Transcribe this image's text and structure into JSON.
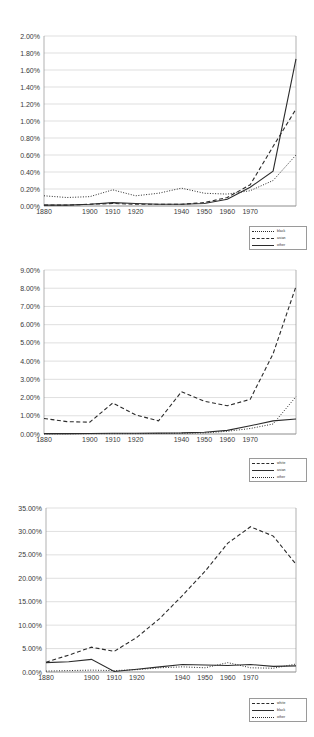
{
  "page": {
    "background": "#ffffff",
    "line_color": "#2b2b2b",
    "grid_color": "#c9c9c9"
  },
  "charts": [
    {
      "id": "chart-1",
      "chart_data": {
        "type": "line",
        "title": "",
        "xlabel": "",
        "ylabel": "",
        "grid": true,
        "legend_position": "bottom-right",
        "xlim": [
          1880,
          1990
        ],
        "ylim": [
          0,
          2.0
        ],
        "yunit": "%",
        "xticks": [
          1880,
          1900,
          1910,
          1920,
          1940,
          1950,
          1960,
          1970
        ],
        "xticklabels": [
          "1880",
          "1900",
          "1910",
          "1920",
          "1940",
          "1950",
          "1960",
          "1970"
        ],
        "yticks": [
          0,
          0.2,
          0.4,
          0.6,
          0.8,
          1.0,
          1.2,
          1.4,
          1.6,
          1.8,
          2.0
        ],
        "yticklabels": [
          "0.00%",
          "0.20%",
          "0.40%",
          "0.60%",
          "0.80%",
          "1.00%",
          "1.20%",
          "1.40%",
          "1.60%",
          "1.80%",
          "2.00%"
        ],
        "x": [
          1880,
          1890,
          1900,
          1910,
          1920,
          1930,
          1940,
          1950,
          1960,
          1970,
          1980,
          1990
        ],
        "series": [
          {
            "name": "black",
            "style": "dotted",
            "values": [
              0.12,
              0.1,
              0.11,
              0.19,
              0.12,
              0.15,
              0.21,
              0.15,
              0.14,
              0.18,
              0.3,
              0.6
            ]
          },
          {
            "name": "asian",
            "style": "dashed",
            "values": [
              0.01,
              0.01,
              0.02,
              0.03,
              0.02,
              0.02,
              0.02,
              0.04,
              0.1,
              0.25,
              0.7,
              1.14
            ]
          },
          {
            "name": "other",
            "style": "solid",
            "values": [
              0.01,
              0.01,
              0.02,
              0.04,
              0.03,
              0.02,
              0.02,
              0.03,
              0.08,
              0.22,
              0.41,
              1.73
            ]
          }
        ]
      },
      "legend": [
        {
          "label": "black",
          "style": "dotted"
        },
        {
          "label": "asian",
          "style": "dashed"
        },
        {
          "label": "other",
          "style": "solid"
        }
      ]
    },
    {
      "id": "chart-2",
      "chart_data": {
        "type": "line",
        "title": "",
        "xlabel": "",
        "ylabel": "",
        "grid": true,
        "legend_position": "bottom-right",
        "xlim": [
          1880,
          1990
        ],
        "ylim": [
          0,
          9.0
        ],
        "yunit": "%",
        "xticks": [
          1880,
          1900,
          1910,
          1920,
          1940,
          1950,
          1960,
          1970
        ],
        "xticklabels": [
          "1880",
          "1900",
          "1910",
          "1920",
          "1940",
          "1950",
          "1960",
          "1970"
        ],
        "yticks": [
          0,
          1,
          2,
          3,
          4,
          5,
          6,
          7,
          8,
          9
        ],
        "yticklabels": [
          "0.00%",
          "1.00%",
          "2.00%",
          "3.00%",
          "4.00%",
          "5.00%",
          "6.00%",
          "7.00%",
          "8.00%",
          "9.00%"
        ],
        "x": [
          1880,
          1890,
          1900,
          1910,
          1920,
          1930,
          1940,
          1950,
          1960,
          1970,
          1980,
          1990
        ],
        "series": [
          {
            "name": "white",
            "style": "dashed",
            "values": [
              0.85,
              0.68,
              0.65,
              1.7,
              1.05,
              0.72,
              2.32,
              1.8,
              1.55,
              1.9,
              4.4,
              8.1
            ]
          },
          {
            "name": "asian",
            "style": "solid",
            "values": [
              0.02,
              0.02,
              0.03,
              0.04,
              0.04,
              0.05,
              0.06,
              0.1,
              0.2,
              0.45,
              0.72,
              0.82
            ]
          },
          {
            "name": "other",
            "style": "dotted",
            "values": [
              0.01,
              0.01,
              0.02,
              0.02,
              0.02,
              0.03,
              0.04,
              0.06,
              0.15,
              0.3,
              0.55,
              2.05
            ]
          }
        ]
      },
      "legend": [
        {
          "label": "white",
          "style": "dashed"
        },
        {
          "label": "asian",
          "style": "solid"
        },
        {
          "label": "other",
          "style": "dotted"
        }
      ]
    },
    {
      "id": "chart-3",
      "chart_data": {
        "type": "line",
        "title": "",
        "xlabel": "",
        "ylabel": "",
        "grid": true,
        "legend_position": "bottom-right",
        "xlim": [
          1880,
          1990
        ],
        "ylim": [
          0,
          35.0
        ],
        "yunit": "%",
        "xticks": [
          1880,
          1900,
          1910,
          1920,
          1940,
          1950,
          1960,
          1970
        ],
        "xticklabels": [
          "1880",
          "1900",
          "1910",
          "1920",
          "1940",
          "1950",
          "1960",
          "1970"
        ],
        "yticks": [
          0,
          5,
          10,
          15,
          20,
          25,
          30,
          35
        ],
        "yticklabels": [
          "0.00%",
          "5.00%",
          "10.00%",
          "15.00%",
          "20.00%",
          "25.00%",
          "30.00%",
          "35.00%"
        ],
        "x": [
          1880,
          1890,
          1900,
          1910,
          1920,
          1930,
          1940,
          1950,
          1960,
          1970,
          1980,
          1990
        ],
        "series": [
          {
            "name": "white",
            "style": "dashed",
            "values": [
              2.1,
              3.6,
              5.3,
              4.4,
              7.4,
              11.4,
              16.3,
              21.5,
              27.5,
              31.0,
              29.0,
              23.0
            ]
          },
          {
            "name": "black",
            "style": "solid",
            "values": [
              2.0,
              2.2,
              2.7,
              0.1,
              0.6,
              1.1,
              1.6,
              1.5,
              1.4,
              1.6,
              1.2,
              1.3
            ]
          },
          {
            "name": "other",
            "style": "dotted",
            "values": [
              0.2,
              0.3,
              0.4,
              0.3,
              0.5,
              0.9,
              1.1,
              0.9,
              2.0,
              0.9,
              0.8,
              1.7
            ]
          }
        ]
      },
      "legend": [
        {
          "label": "white",
          "style": "dashed"
        },
        {
          "label": "black",
          "style": "solid"
        },
        {
          "label": "other",
          "style": "dotted"
        }
      ]
    }
  ]
}
